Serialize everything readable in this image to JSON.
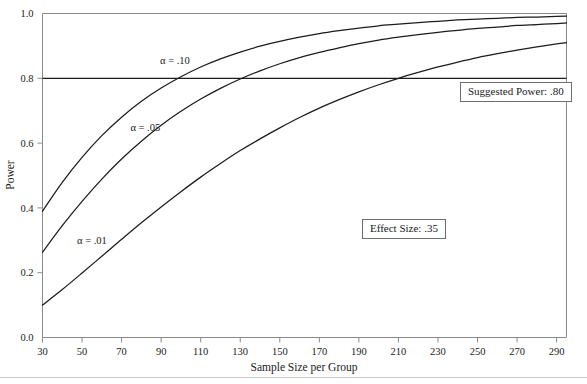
{
  "chart_data": {
    "type": "line",
    "title": "",
    "xlabel": "Sample Size per Group",
    "ylabel": "Power",
    "xlim": [
      30,
      295
    ],
    "ylim": [
      0.0,
      1.0
    ],
    "grid": false,
    "legend": "inline-curve-labels",
    "xticks": [
      30,
      50,
      70,
      90,
      110,
      130,
      150,
      170,
      190,
      210,
      230,
      250,
      270,
      290
    ],
    "xtick_labels": [
      "30",
      "50",
      "70",
      "90",
      "110",
      "130",
      "150",
      "170",
      "190",
      "210",
      "230",
      "250",
      "270",
      "290"
    ],
    "yticks": [
      0.0,
      0.2,
      0.4,
      0.6,
      0.8,
      1.0
    ],
    "ytick_labels": [
      "0.0",
      "0.2",
      "0.4",
      "0.6",
      "0.8",
      "1.0"
    ],
    "x": [
      30,
      40,
      50,
      60,
      70,
      80,
      90,
      100,
      110,
      120,
      130,
      140,
      150,
      160,
      170,
      180,
      190,
      200,
      210,
      220,
      230,
      240,
      250,
      260,
      270,
      280,
      290,
      295
    ],
    "series": [
      {
        "name": "alpha = .10",
        "label": "α = .10",
        "alpha": 0.1,
        "color": "#1c1c1c",
        "values": [
          0.39,
          0.479,
          0.556,
          0.623,
          0.68,
          0.729,
          0.77,
          0.805,
          0.835,
          0.86,
          0.881,
          0.899,
          0.914,
          0.927,
          0.938,
          0.947,
          0.955,
          0.962,
          0.967,
          0.972,
          0.976,
          0.98,
          0.983,
          0.985,
          0.988,
          0.989,
          0.991,
          0.992
        ]
      },
      {
        "name": "alpha = .05",
        "label": "α = .05",
        "alpha": 0.05,
        "color": "#1c1c1c",
        "values": [
          0.263,
          0.345,
          0.42,
          0.489,
          0.551,
          0.606,
          0.655,
          0.698,
          0.736,
          0.769,
          0.798,
          0.823,
          0.845,
          0.864,
          0.88,
          0.894,
          0.907,
          0.918,
          0.927,
          0.935,
          0.942,
          0.948,
          0.954,
          0.958,
          0.963,
          0.966,
          0.969,
          0.971
        ]
      },
      {
        "name": "alpha = .01",
        "label": "α = .01",
        "alpha": 0.01,
        "color": "#1c1c1c",
        "values": [
          0.1,
          0.148,
          0.199,
          0.251,
          0.303,
          0.354,
          0.403,
          0.45,
          0.495,
          0.537,
          0.577,
          0.613,
          0.647,
          0.679,
          0.708,
          0.734,
          0.758,
          0.78,
          0.8,
          0.818,
          0.835,
          0.85,
          0.864,
          0.876,
          0.887,
          0.897,
          0.906,
          0.91
        ]
      }
    ],
    "reference_line": {
      "name": "suggested-power",
      "axis": "y",
      "value": 0.8,
      "color": "#1c1c1c"
    },
    "curve_labels": [
      {
        "text": "α = .10",
        "x": 97,
        "y": 0.845
      },
      {
        "text": "α = .05",
        "x": 82,
        "y": 0.638
      },
      {
        "text": "α = .01",
        "x": 55,
        "y": 0.29
      }
    ],
    "annotations": [
      {
        "name": "suggested-power",
        "text": "Suggested Power: .80"
      },
      {
        "name": "effect-size",
        "text": "Effect Size: .35"
      }
    ]
  },
  "axes": {
    "x_title": "Sample Size per Group",
    "y_title": "Power"
  },
  "annotations": {
    "suggested_power": "Suggested Power: .80",
    "effect_size": "Effect Size: .35"
  },
  "curve_labels": {
    "alpha_10": "α = .10",
    "alpha_05": "α = .05",
    "alpha_01": "α = .01"
  }
}
